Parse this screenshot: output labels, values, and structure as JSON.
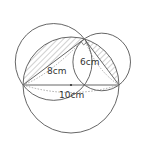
{
  "diagram": {
    "type": "geometry",
    "labels": {
      "leg_left": "8cm",
      "leg_right": "6cm",
      "hypotenuse": "10cm"
    },
    "points": {
      "A": [
        23,
        85
      ],
      "B": [
        119,
        85
      ],
      "C": [
        84.4,
        38.9
      ],
      "O": [
        71,
        85
      ]
    },
    "circles": {
      "big": {
        "cx": 71,
        "cy": 85,
        "r": 48
      },
      "on_AC": {
        "cx": 53.7,
        "cy": 61.95,
        "r": 38.4
      },
      "on_BC": {
        "cx": 101.7,
        "cy": 61.95,
        "r": 28.8
      }
    },
    "colors": {
      "stroke": "#555555",
      "hatch": "#8a8a8a",
      "dashed": "#888888"
    }
  }
}
